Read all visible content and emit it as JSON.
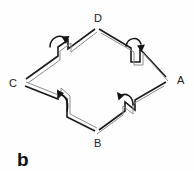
{
  "figure": {
    "panel_label": "b",
    "background_color": "#ffffff",
    "line_color": "#1b1b1b",
    "secondary_line_color": "#8c8c8c",
    "arrow_color": "#141414",
    "width": 194,
    "height": 171
  },
  "vertices": [
    {
      "id": "D",
      "label": "D",
      "x": 97,
      "y": 28,
      "label_x": 94,
      "label_y": 19,
      "position": "top"
    },
    {
      "id": "A",
      "label": "A",
      "x": 167,
      "y": 80,
      "label_x": 176,
      "label_y": 84,
      "position": "right"
    },
    {
      "id": "B",
      "label": "B",
      "x": 97,
      "y": 133,
      "label_x": 94,
      "label_y": 146,
      "position": "bottom"
    },
    {
      "id": "C",
      "label": "C",
      "x": 24,
      "y": 82,
      "label_x": 11,
      "label_y": 86,
      "position": "left"
    }
  ],
  "edges": [
    {
      "id": "CD",
      "from": "C",
      "to": "D",
      "has_step": true,
      "step_direction": "down",
      "rotation_arrow": "clockwise"
    },
    {
      "id": "DA",
      "from": "D",
      "to": "A",
      "has_step": true,
      "step_direction": "down",
      "rotation_arrow": "clockwise"
    },
    {
      "id": "BA",
      "from": "B",
      "to": "A",
      "has_step": true,
      "step_direction": "up",
      "rotation_arrow": "counterclockwise"
    },
    {
      "id": "CB",
      "from": "C",
      "to": "B",
      "has_step": true,
      "step_direction": "up",
      "rotation_arrow": "counterclockwise"
    }
  ],
  "geometry": {
    "shape": "rhombus",
    "edge_style": "double-line-band",
    "step_offset_px": 9
  }
}
